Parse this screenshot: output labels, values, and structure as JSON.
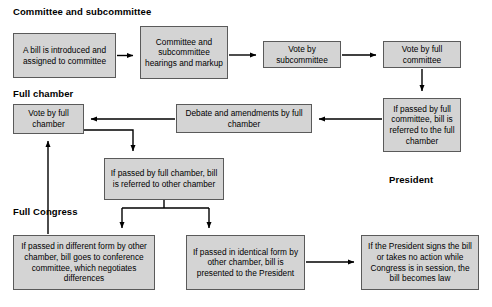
{
  "diagram": {
    "colors": {
      "node_fill": "#d4d4d4",
      "node_border": "#5a5a5a",
      "connector": "#000000",
      "background": "#ffffff",
      "text": "#000000"
    },
    "section_labels": [
      {
        "id": "committee",
        "text": "Committee and subcommittee",
        "x": 13,
        "y": 6
      },
      {
        "id": "full-chamber",
        "text": "Full chamber",
        "x": 13,
        "y": 88
      },
      {
        "id": "full-congress",
        "text": "Full Congress",
        "x": 13,
        "y": 206
      },
      {
        "id": "president",
        "text": "President",
        "x": 389,
        "y": 174
      }
    ],
    "nodes": [
      {
        "id": "bill-introduced",
        "text": "A bill is introduced and assigned to committee",
        "x": 13,
        "y": 33,
        "w": 103,
        "h": 45
      },
      {
        "id": "committee-hearings",
        "text": "Committee and subcommittee hearings and markup",
        "x": 140,
        "y": 26,
        "w": 88,
        "h": 53
      },
      {
        "id": "vote-subcommittee",
        "text": "Vote by subcommittee",
        "x": 263,
        "y": 41,
        "w": 78,
        "h": 27
      },
      {
        "id": "vote-full-committee",
        "text": "Vote by full committee",
        "x": 383,
        "y": 41,
        "w": 78,
        "h": 27
      },
      {
        "id": "passed-committee",
        "text": "If passed by full committee, bill is referred to the full chamber",
        "x": 383,
        "y": 98,
        "w": 78,
        "h": 54
      },
      {
        "id": "debate-amendments",
        "text": "Debate and amendments by full chamber",
        "x": 176,
        "y": 104,
        "w": 136,
        "h": 29
      },
      {
        "id": "vote-full-chamber",
        "text": "Vote by full chamber",
        "x": 13,
        "y": 104,
        "w": 71,
        "h": 30
      },
      {
        "id": "passed-full-chamber",
        "text": "If passed by full chamber, bill is referred to other chamber",
        "x": 104,
        "y": 158,
        "w": 120,
        "h": 42
      },
      {
        "id": "different-form",
        "text": "If passed in different form by other chamber, bill goes to conference committee, which negotiates differences",
        "x": 13,
        "y": 235,
        "w": 142,
        "h": 55
      },
      {
        "id": "identical-form",
        "text": "If passed in identical form by other chamber, bill is presented to the President",
        "x": 186,
        "y": 235,
        "w": 119,
        "h": 55
      },
      {
        "id": "becomes-law",
        "text": "If the President signs the bill or takes no action while Congress is in session, the bill becomes law",
        "x": 361,
        "y": 235,
        "w": 118,
        "h": 55
      }
    ],
    "connectors": [
      {
        "id": "bill-to-hearings",
        "from": "bill-introduced",
        "to": "committee-hearings"
      },
      {
        "id": "hearings-to-subcommittee-vote",
        "from": "committee-hearings",
        "to": "vote-subcommittee"
      },
      {
        "id": "subcommittee-vote-to-committee-vote",
        "from": "vote-subcommittee",
        "to": "vote-full-committee"
      },
      {
        "id": "committee-vote-to-passed-committee",
        "from": "vote-full-committee",
        "to": "passed-committee"
      },
      {
        "id": "passed-committee-to-debate",
        "from": "passed-committee",
        "to": "debate-amendments"
      },
      {
        "id": "debate-to-vote-chamber",
        "from": "debate-amendments",
        "to": "vote-full-chamber"
      },
      {
        "id": "vote-chamber-to-passed-chamber",
        "from": "vote-full-chamber",
        "to": "passed-full-chamber"
      },
      {
        "id": "passed-chamber-to-different-form",
        "from": "passed-full-chamber",
        "to": "different-form"
      },
      {
        "id": "passed-chamber-to-identical-form",
        "from": "passed-full-chamber",
        "to": "identical-form"
      },
      {
        "id": "different-form-to-vote-chamber",
        "from": "different-form",
        "to": "vote-full-chamber"
      },
      {
        "id": "identical-form-to-becomes-law",
        "from": "identical-form",
        "to": "becomes-law"
      }
    ]
  }
}
